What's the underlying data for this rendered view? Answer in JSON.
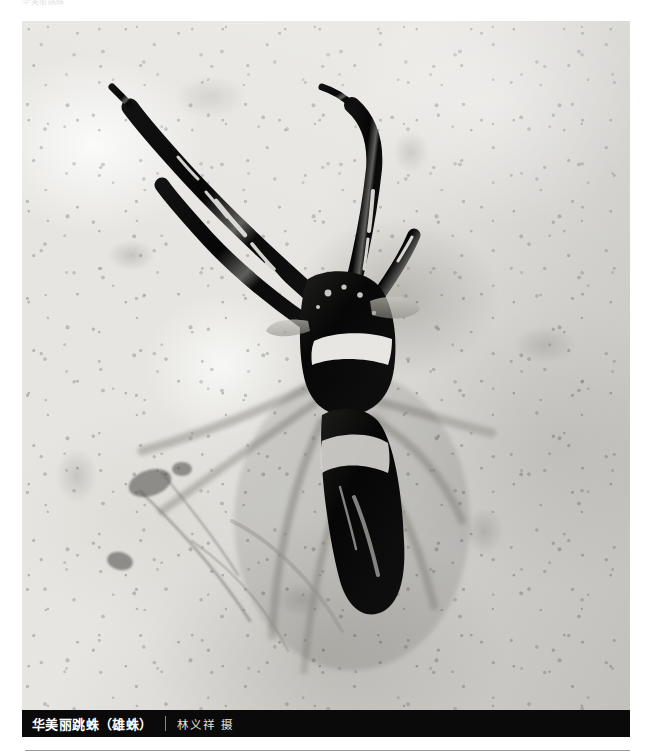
{
  "page": {
    "background_color": "#ffffff",
    "width": 653,
    "height": 754
  },
  "running_header": {
    "text": "华美丽跳蛛"
  },
  "photo": {
    "alt_name": "jumping-spider-photo",
    "subject": "华美丽跳蛛 (雄蛛)",
    "rendering": "black-and-white macro photograph",
    "background_description": "granular pale rock surface",
    "colors": {
      "rock_light": "#f7f6f3",
      "rock_mid": "#dddbd5",
      "rock_dark": "#b6b4ad",
      "spider_body": "#0d0d0d",
      "spider_highlight": "#f2f1ee"
    }
  },
  "caption": {
    "title": "华美丽跳蛛（雄蛛）",
    "credit": "林义祥 摄"
  }
}
